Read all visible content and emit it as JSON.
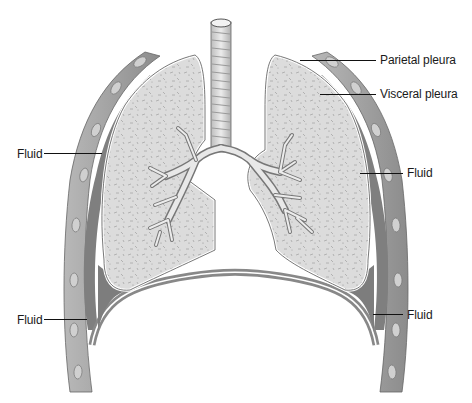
{
  "diagram": {
    "title": "",
    "colors": {
      "background": "#ffffff",
      "lung_tissue": "#d9d9d9",
      "lung_speckle": "#a8a8a8",
      "pleura_line": "#ffffff",
      "pleura_outline": "#555555",
      "chest_wall": "#9a9a9a",
      "fluid_cavity": "#7d7d7d",
      "rib": "#c8c8c8",
      "leader_line": "#111111",
      "label_text": "#1a1a1a"
    },
    "labels": [
      {
        "id": "parietal-pleura",
        "text": "Parietal pleura",
        "x": 380,
        "y": 53,
        "line_from": [
          300,
          60
        ],
        "line_to": [
          376,
          60
        ]
      },
      {
        "id": "visceral-pleura",
        "text": "Visceral pleura",
        "x": 380,
        "y": 87,
        "line_from": [
          320,
          94
        ],
        "line_to": [
          376,
          94
        ]
      },
      {
        "id": "fluid-left-upper",
        "text": "Fluid",
        "x": 17,
        "y": 147,
        "line_from": [
          44,
          153
        ],
        "line_to": [
          102,
          153
        ]
      },
      {
        "id": "fluid-right-upper",
        "text": "Fluid",
        "x": 407,
        "y": 166,
        "line_from": [
          360,
          173
        ],
        "line_to": [
          403,
          173
        ]
      },
      {
        "id": "fluid-left-lower",
        "text": "Fluid",
        "x": 17,
        "y": 313,
        "line_from": [
          44,
          319
        ],
        "line_to": [
          87,
          319
        ]
      },
      {
        "id": "fluid-right-lower",
        "text": "Fluid",
        "x": 407,
        "y": 308,
        "line_from": [
          373,
          314
        ],
        "line_to": [
          403,
          314
        ]
      }
    ],
    "structures": [
      "trachea",
      "left lung",
      "right lung",
      "bronchial tree",
      "diaphragm",
      "chest wall with ribs",
      "pleural cavity"
    ]
  }
}
